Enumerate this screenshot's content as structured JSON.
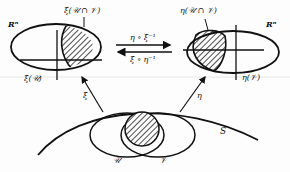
{
  "diagram": {
    "left_chart": {
      "space_label": "Rⁿ",
      "image_label": "ξ(𝒰)",
      "intersection_label": "ξ(𝒰 ∩ 𝒱)"
    },
    "right_chart": {
      "space_label": "Rⁿ",
      "image_label": "η(𝒱)",
      "intersection_label": "η(𝒰 ∩ 𝒱)"
    },
    "transition_maps": {
      "forward": "η ∘ ξ⁻¹",
      "backward": "ξ ∘ η⁻¹"
    },
    "chart_maps": {
      "left": "ξ",
      "right": "η"
    },
    "surface": {
      "label": "S",
      "set_u": "𝒰",
      "set_v": "𝒱"
    }
  }
}
